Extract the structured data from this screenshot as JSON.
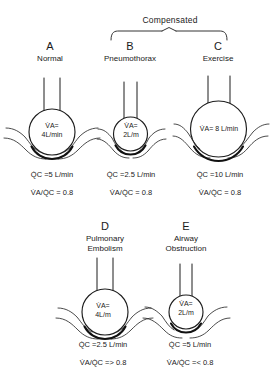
{
  "figure": {
    "group_label": "Compensated",
    "row1": [
      {
        "letter": "A",
        "title": "Normal",
        "va_line1": "V̇A=",
        "va_line2": "4L/min",
        "va_single": "",
        "qc": "Q̇C =5 L/min",
        "ratio": "V̇A/Q̇C = 0.8"
      },
      {
        "letter": "B",
        "title": "Pneumothorax",
        "va_line1": "V̇A=",
        "va_line2": "2L/m",
        "va_single": "",
        "qc": "Q̇C =2.5 L/min",
        "ratio": "V̇A/Q̇C = 0.8"
      },
      {
        "letter": "C",
        "title": "Exercise",
        "va_line1": "",
        "va_line2": "",
        "va_single": "V̇A= 8 L/min",
        "qc": "Q̇C =10 L/min",
        "ratio": "V̇A/Q̇C = 0.8"
      }
    ],
    "row2": [
      {
        "letter": "D",
        "title_line1": "Pulmonary",
        "title_line2": "Embolism",
        "va_line1": "V̇A=",
        "va_line2": "4L/m",
        "qc": "Q̇C =2.5 L/min",
        "ratio": "V̇A/Q̇C => 0.8"
      },
      {
        "letter": "E",
        "title_line1": "Airway",
        "title_line2": "Obstruction",
        "va_line1": "V̇A=",
        "va_line2": "2L/m",
        "qc": "Q̇C =5 L/min",
        "ratio": "V̇A/Q̇C =< 0.8"
      }
    ]
  },
  "colors": {
    "ink": "#1d1d1d",
    "background": "#ffffff"
  }
}
